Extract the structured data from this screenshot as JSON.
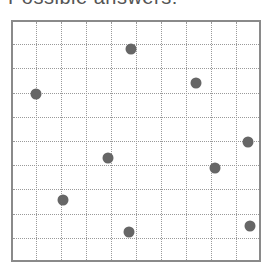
{
  "title": "Possible answers:",
  "grid": {
    "columns": 10,
    "rows": 10,
    "left": 11,
    "top": 20,
    "width": 250,
    "height": 242,
    "line_color": "#9a9a9a",
    "border_color": "#8a8a8a"
  },
  "points": [
    {
      "x": 131,
      "y": 49
    },
    {
      "x": 196,
      "y": 83
    },
    {
      "x": 36,
      "y": 94
    },
    {
      "x": 248,
      "y": 142
    },
    {
      "x": 108,
      "y": 158
    },
    {
      "x": 215,
      "y": 168
    },
    {
      "x": 63,
      "y": 200
    },
    {
      "x": 250,
      "y": 226
    },
    {
      "x": 129,
      "y": 232
    }
  ],
  "point_color": "#666666"
}
